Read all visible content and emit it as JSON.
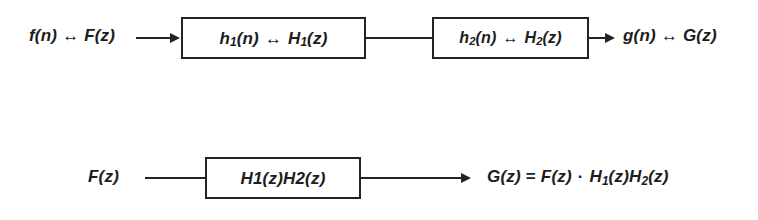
{
  "diagram": {
    "stroke_color": "#232323",
    "text_color": "#1d1d1d",
    "background_color": "#ffffff",
    "top_row": {
      "input_label": {
        "full_text": "f(n) ↔ F(z)",
        "time_domain": "f(n)",
        "transform_operator": "↔",
        "z_domain": "F(z)"
      },
      "block_1": {
        "time_domain": "h",
        "time_domain_subscript": "1",
        "time_domain_arg": "(n)",
        "transform_operator": "↔",
        "z_domain": "H",
        "z_domain_subscript": "1",
        "z_domain_arg": "(z)",
        "full_text": "h1(n) ↔ H1(z)"
      },
      "block_2": {
        "time_domain": "h",
        "time_domain_subscript": "2",
        "time_domain_arg": "(n)",
        "transform_operator": "↔",
        "z_domain": "H",
        "z_domain_subscript": "2",
        "z_domain_arg": "(z)",
        "full_text": "h2(n) ↔ H2(z)"
      },
      "output_label": {
        "full_text": "g(n) ↔ G(z)",
        "time_domain": "g(n)",
        "transform_operator": "↔",
        "z_domain": "G(z)"
      }
    },
    "bottom_row": {
      "input_label": {
        "full_text": "F(z)"
      },
      "block_combined": {
        "full_text": "H1(z)H2(z)",
        "first_factor": "H1(z)",
        "second_factor": "H2(z)"
      },
      "output_equation": {
        "full_text": "G(z) = F(z) · H1(z)H2(z)",
        "left_side": "G(z)",
        "equals": "=",
        "input_term": "F(z)",
        "multiply_operator": "·",
        "transfer_term_1_base": "H",
        "transfer_term_1_sub": "1",
        "transfer_term_1_arg": "(z)",
        "transfer_term_2_base": "H",
        "transfer_term_2_sub": "2",
        "transfer_term_2_arg": "(z)"
      }
    }
  }
}
